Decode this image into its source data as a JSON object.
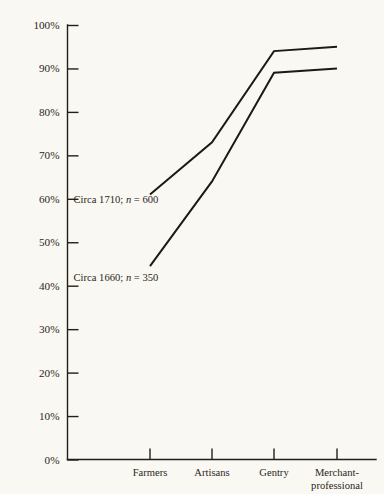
{
  "chart_data": {
    "type": "line",
    "title": "",
    "subtitle": "",
    "xlabel": "",
    "ylabel": "",
    "categories": [
      "Farmers",
      "Artisans",
      "Gentry",
      "Merchant-professional"
    ],
    "category_labels_wrapped": [
      [
        "Farmers"
      ],
      [
        "Artisans"
      ],
      [
        "Gentry"
      ],
      [
        "Merchant-",
        "professional"
      ]
    ],
    "ylim": [
      0,
      100
    ],
    "ytick_values": [
      0,
      10,
      20,
      30,
      40,
      50,
      60,
      70,
      80,
      90,
      100
    ],
    "ytick_labels": [
      "0%",
      "10%",
      "20%",
      "30%",
      "40%",
      "50%",
      "60%",
      "70%",
      "80%",
      "90%",
      "100%"
    ],
    "grid": false,
    "legend_position": "inline-annotation",
    "series": [
      {
        "name": "Circa 1710; n = 600",
        "label_prefix": "Circa 1710; ",
        "label_italic": "n",
        "label_suffix": " = 600",
        "sample_size": 600,
        "year": 1710,
        "values": [
          61,
          73,
          94,
          95
        ]
      },
      {
        "name": "Circa 1660; n = 350",
        "label_prefix": "Circa 1660; ",
        "label_italic": "n",
        "label_suffix": " = 350",
        "sample_size": 350,
        "year": 1660,
        "values": [
          44.5,
          64,
          89,
          90
        ]
      }
    ],
    "annotations": [
      {
        "text": "Circa 1710; n = 600",
        "at_percent": 60,
        "series_index": 0
      },
      {
        "text": "Circa 1660; n = 350",
        "at_percent": 42,
        "series_index": 1
      }
    ],
    "colors": {
      "background": "#faf8f2",
      "ink": "#1d1a12",
      "axis": "#241f16",
      "text": "#2b261c"
    }
  }
}
